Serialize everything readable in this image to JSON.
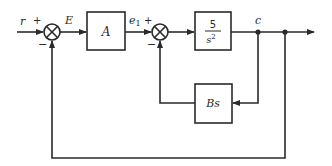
{
  "diagram": {
    "type": "control-system-block-diagram",
    "signals": {
      "input": "r",
      "error": "E",
      "inner_error": "e",
      "inner_error_sub": "1",
      "output": "c"
    },
    "summing_junctions": [
      {
        "id": "sum1",
        "plus_sign": "+",
        "minus_sign": "−"
      },
      {
        "id": "sum2",
        "plus_sign": "+",
        "minus_sign": "−"
      }
    ],
    "blocks": {
      "controller": {
        "label": "A"
      },
      "plant": {
        "numerator": "5",
        "denominator": "s",
        "denominator_exp": "2"
      },
      "feedback": {
        "label": "Bs"
      }
    },
    "colors": {
      "line": "#2a2a2a",
      "background": "#ffffff"
    }
  }
}
